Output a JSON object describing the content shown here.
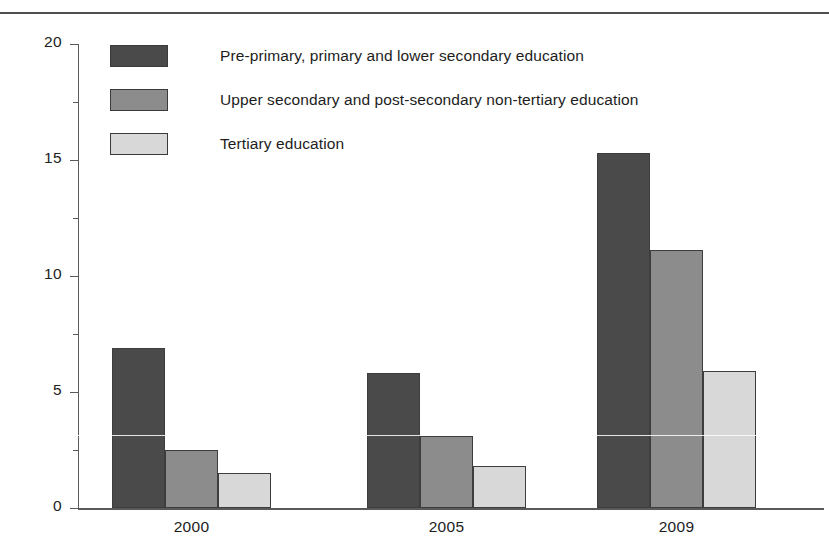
{
  "chart_data": {
    "type": "bar",
    "title": "",
    "subtitle": "",
    "xlabel": "",
    "ylabel": "",
    "categories": [
      "2000",
      "2005",
      "2009"
    ],
    "series": [
      {
        "name": "Pre-primary, primary and lower secondary education",
        "color": "#4a4a4a",
        "values": [
          6.9,
          5.8,
          15.3
        ]
      },
      {
        "name": "Upper secondary and post-secondary non-tertiary education",
        "color": "#8c8c8c",
        "values": [
          2.5,
          3.1,
          11.1
        ]
      },
      {
        "name": "Tertiary education",
        "color": "#d8d8d8",
        "values": [
          1.5,
          1.8,
          5.9
        ]
      }
    ],
    "ylim": [
      0,
      20
    ],
    "yticks": [
      0,
      5,
      10,
      15,
      20
    ],
    "ytick_labels": [
      "0",
      "5",
      "10",
      "15",
      "20"
    ],
    "grid": false,
    "legend_position": "top-left",
    "bar_border_color": "#3d3d3d",
    "axis_color": "#5a5a5a"
  },
  "legend": {
    "items": [
      {
        "label": "Pre-primary, primary and lower secondary education",
        "swatch": "#4a4a4a"
      },
      {
        "label": "Upper secondary and post-secondary non-tertiary education",
        "swatch": "#8c8c8c"
      },
      {
        "label": "Tertiary education",
        "swatch": "#d8d8d8"
      }
    ]
  }
}
